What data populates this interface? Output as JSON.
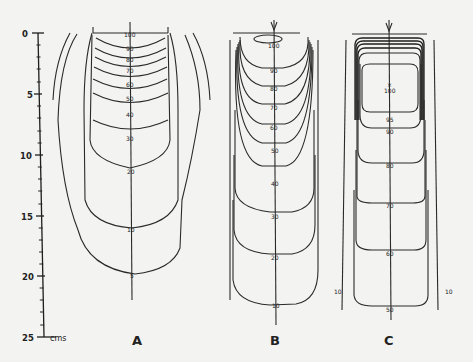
{
  "scale": {
    "unit": "cms",
    "ticks": [
      "0",
      "5",
      "10",
      "15",
      "20",
      "25"
    ]
  },
  "panels": {
    "A": {
      "label": "A",
      "isodose": [
        "100",
        "90",
        "80",
        "70",
        "60",
        "50",
        "40",
        "30",
        "20",
        "10",
        "5"
      ]
    },
    "B": {
      "label": "B",
      "isodose": [
        "100",
        "90",
        "80",
        "70",
        "60",
        "50",
        "40",
        "30",
        "20",
        "10"
      ]
    },
    "C": {
      "label": "C",
      "isodose": [
        "100",
        "95",
        "90",
        "80",
        "70",
        "60",
        "50"
      ],
      "side_left": "10",
      "side_right": "10"
    }
  }
}
